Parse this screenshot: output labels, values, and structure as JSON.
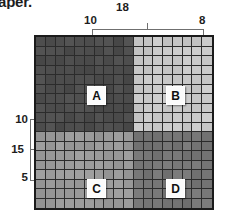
{
  "caption_fragment": "aper.",
  "top_axis": {
    "total_label": "18",
    "left_segment_label": "10",
    "right_segment_label": "8"
  },
  "left_axis": {
    "top_label": "10",
    "middle_label": "15",
    "bottom_label": "5"
  },
  "regions": [
    {
      "id": "A",
      "label": "A",
      "position": "top-left",
      "color": "#4d4d4d"
    },
    {
      "id": "B",
      "label": "B",
      "position": "top-right",
      "color": "#c8c8c8"
    },
    {
      "id": "C",
      "label": "C",
      "position": "bottom-left",
      "color": "#9a9a9a"
    },
    {
      "id": "D",
      "label": "D",
      "position": "bottom-right",
      "color": "#767676"
    }
  ],
  "chart_data": {
    "type": "heatmap",
    "title": "",
    "xlabel": "",
    "ylabel": "",
    "grid": true,
    "legend": "none",
    "columns": 18,
    "rows": 18,
    "split_column": 10,
    "split_row": 10,
    "x_segments": [
      {
        "label": "10",
        "span": 10
      },
      {
        "label": "8",
        "span": 8
      }
    ],
    "x_total": {
      "label": "18",
      "span": 18
    },
    "y_segments": [
      {
        "label": "10",
        "span": 10
      },
      {
        "label": "5",
        "span": 8
      }
    ],
    "y_total": {
      "label": "15",
      "span": 18
    },
    "quadrants": [
      {
        "name": "A",
        "row_range": [
          0,
          9
        ],
        "col_range": [
          0,
          9
        ],
        "value": 0.2,
        "color": "#4d4d4d"
      },
      {
        "name": "B",
        "row_range": [
          0,
          9
        ],
        "col_range": [
          10,
          17
        ],
        "value": 0.8,
        "color": "#c8c8c8"
      },
      {
        "name": "C",
        "row_range": [
          10,
          17
        ],
        "col_range": [
          0,
          9
        ],
        "value": 0.6,
        "color": "#9a9a9a"
      },
      {
        "name": "D",
        "row_range": [
          10,
          17
        ],
        "col_range": [
          10,
          17
        ],
        "value": 0.42,
        "color": "#767676"
      }
    ],
    "gridline_color": "#2b2b2b",
    "border_color": "#1b1b1b",
    "bracket_color": "#6f6f6f"
  }
}
